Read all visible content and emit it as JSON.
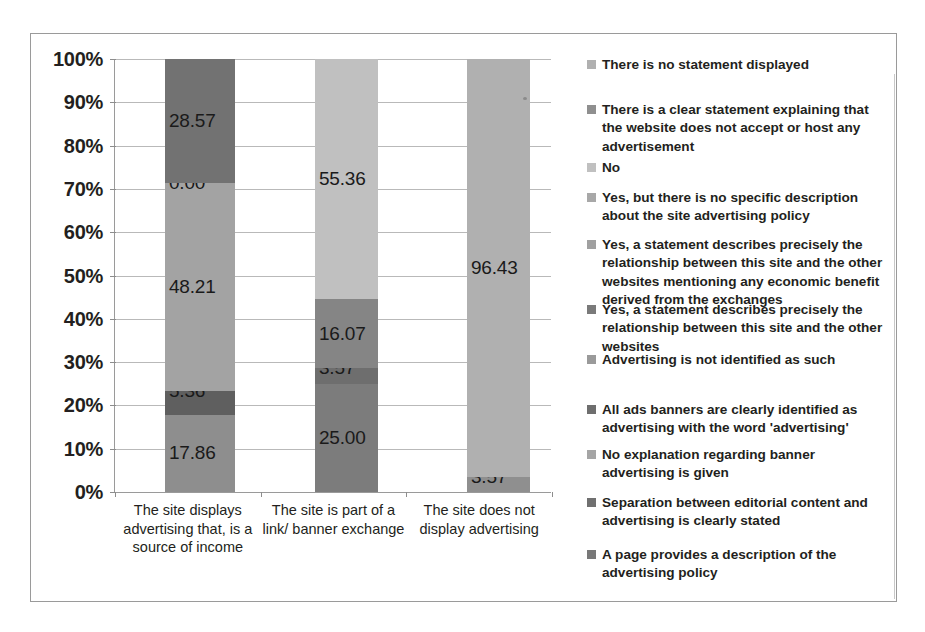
{
  "chart_data": {
    "type": "bar",
    "subtype": "stacked-100-percent",
    "title": "",
    "xlabel": "",
    "ylabel": "",
    "ylim": [
      0,
      100
    ],
    "grid": true,
    "legend_position": "right",
    "ytick_labels": [
      "0%",
      "10%",
      "20%",
      "30%",
      "40%",
      "50%",
      "60%",
      "70%",
      "80%",
      "90%",
      "100%"
    ],
    "ytick_values": [
      0,
      10,
      20,
      30,
      40,
      50,
      60,
      70,
      80,
      90,
      100
    ],
    "categories": [
      "The site displays advertising that, is a source of income",
      "The site is part of a link/ banner exchange",
      "The site does not display advertising"
    ],
    "bars": [
      {
        "category": "The site displays advertising that, is a source of income",
        "segments": [
          {
            "label": "17.86",
            "value": 17.86,
            "color": "#8e8e8e",
            "series": "No explanation regarding banner advertising is given"
          },
          {
            "label": "5.36",
            "value": 5.36,
            "color": "#5f5f5f",
            "series": "All ads banners are clearly identified as advertising with the word 'advertising'"
          },
          {
            "label": "48.21",
            "value": 48.21,
            "color": "#a3a3a3",
            "series": "Advertising is not identified as such"
          },
          {
            "label": "0.00",
            "value": 0.0,
            "color": "#7a7a7a",
            "series": "Yes, a statement describes precisely the relationship between this site and the other websites"
          },
          {
            "label": "28.57",
            "value": 28.57,
            "color": "#727272",
            "series": "Yes, but there is no specific description about the site advertising policy"
          }
        ]
      },
      {
        "category": "The site is part of a link/ banner exchange",
        "segments": [
          {
            "label": "25.00",
            "value": 25.0,
            "color": "#7c7c7c",
            "series": "No explanation regarding banner advertising is given"
          },
          {
            "label": "3.57",
            "value": 3.57,
            "color": "#6e6e6e",
            "series": "All ads banners are clearly identified as advertising with the word 'advertising'"
          },
          {
            "label": "16.07",
            "value": 16.07,
            "color": "#858585",
            "series": "Advertising is not identified as such"
          },
          {
            "label": "55.36",
            "value": 55.36,
            "color": "#c0c0c0",
            "series": "No"
          }
        ]
      },
      {
        "category": "The site does not display advertising",
        "segments": [
          {
            "label": "3.57",
            "value": 3.57,
            "color": "#8f8f8f",
            "series": "There is a clear statement explaining that the website does not accept or host any advertisement"
          },
          {
            "label": "96.43",
            "value": 96.43,
            "color": "#b0b0b0",
            "series": "There is no statement displayed"
          }
        ]
      }
    ],
    "legend_entries": [
      {
        "label": "There is no statement displayed",
        "color": "#b0b0b0"
      },
      {
        "label": "There is a clear statement explaining that the website does not accept or host any advertisement",
        "color": "#8f8f8f"
      },
      {
        "label": "No",
        "color": "#c0c0c0"
      },
      {
        "label": "Yes, but there is no specific description about the site advertising policy",
        "color": "#a8a8a8"
      },
      {
        "label": "Yes, a statement describes precisely the relationship between this site and the other websites mentioning any economic benefit derived from the exchanges",
        "color": "#a0a0a0"
      },
      {
        "label": "Yes, a statement describes precisely the relationship between this site and the other websites",
        "color": "#7a7a7a"
      },
      {
        "label": "Advertising is not identified as such",
        "color": "#9a9a9a"
      },
      {
        "label": "All ads banners are clearly identified as advertising with the word 'advertising'",
        "color": "#6e6e6e"
      },
      {
        "label": "No explanation regarding banner advertising is given",
        "color": "#a5a5a5"
      },
      {
        "label": "Separation between editorial content and advertising is clearly stated",
        "color": "#707070"
      },
      {
        "label": "A page provides a description of the advertising policy",
        "color": "#787878"
      }
    ]
  }
}
